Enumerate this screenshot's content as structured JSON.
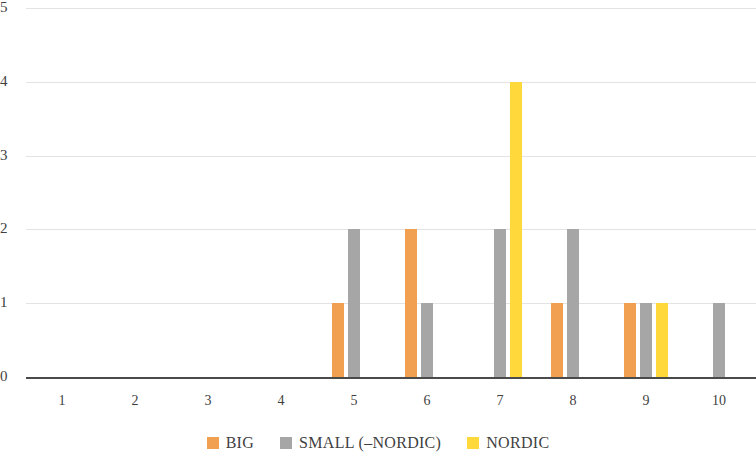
{
  "chart_data": {
    "type": "bar",
    "title": "",
    "subtitle": "",
    "xlabel": "",
    "ylabel": "",
    "categories": [
      "1",
      "2",
      "3",
      "4",
      "5",
      "6",
      "7",
      "8",
      "9",
      "10"
    ],
    "series": [
      {
        "name": "BIG",
        "color": "#F0A050",
        "values": [
          0,
          0,
          0,
          0,
          1,
          2,
          0,
          1,
          1,
          0
        ]
      },
      {
        "name": "SMALL (–NORDIC)",
        "color": "#A6A6A6",
        "values": [
          0,
          0,
          0,
          0,
          2,
          1,
          2,
          2,
          1,
          1
        ]
      },
      {
        "name": "NORDIC",
        "color": "#FFD93B",
        "values": [
          0,
          0,
          0,
          0,
          0,
          0,
          4,
          0,
          1,
          0
        ]
      }
    ],
    "ylim": [
      0,
      5
    ],
    "yticks": [
      0,
      1,
      2,
      3,
      4,
      5
    ],
    "ytick_labels": [
      "0",
      "1",
      "2",
      "3",
      "4",
      "5"
    ],
    "grid": true,
    "grid_color": "#E3E3E3",
    "axis_color": "#4A4A4A",
    "legend_position": "bottom"
  },
  "legend": {
    "items": [
      {
        "label": "BIG",
        "color": "#F0A050"
      },
      {
        "label": "SMALL (–NORDIC)",
        "color": "#A6A6A6"
      },
      {
        "label": "NORDIC",
        "color": "#FFD93B"
      }
    ]
  }
}
